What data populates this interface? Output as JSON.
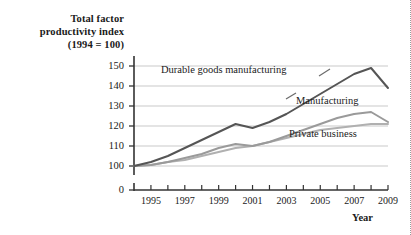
{
  "axis": {
    "y_title_line1": "Total factor",
    "y_title_line2": "productivity index",
    "y_title_line3": "(1994 = 100)",
    "x_title": "Year"
  },
  "chart_data": {
    "type": "line",
    "title": "",
    "subtitle": "",
    "xlabel": "Year",
    "ylabel": "Total factor productivity index (1994 = 100)",
    "grid": true,
    "legend_position": "inline-annotations",
    "xlim": [
      1994,
      2009
    ],
    "ylim": [
      100,
      150
    ],
    "y_axis_break": true,
    "y_ticks": [
      0,
      100,
      110,
      120,
      130,
      140,
      150
    ],
    "y_tick_labels": [
      "0",
      "100",
      "110",
      "120",
      "130",
      "140",
      "150"
    ],
    "x": [
      1994,
      1995,
      1996,
      1997,
      1998,
      1999,
      2000,
      2001,
      2002,
      2003,
      2004,
      2005,
      2006,
      2007,
      2008,
      2009
    ],
    "x_tick_labels": [
      "1995",
      "1997",
      "1999",
      "2001",
      "2003",
      "2005",
      "2007",
      "2009"
    ],
    "x_tick_label_years": [
      1995,
      1997,
      1999,
      2001,
      2003,
      2005,
      2007,
      2009
    ],
    "series": [
      {
        "name": "Durable goods manufacturing",
        "color": "#555555",
        "width": 2.0,
        "values": [
          100,
          102,
          105,
          109,
          113,
          117,
          121,
          119,
          122,
          126,
          131,
          136,
          141,
          146,
          149,
          139
        ]
      },
      {
        "name": "Manufacturing",
        "color": "#9a9a9a",
        "width": 2.0,
        "values": [
          100,
          100.5,
          102,
          104,
          106,
          109,
          111,
          110,
          112,
          115,
          118,
          121,
          124,
          126,
          127,
          122
        ]
      },
      {
        "name": "Private business",
        "color": "#b0b0b0",
        "width": 2.0,
        "values": [
          100,
          100.5,
          102,
          103,
          105,
          107,
          109,
          110,
          112,
          114,
          116,
          118,
          119,
          120,
          121,
          121
        ]
      }
    ],
    "annotations": [
      {
        "text": "Durable goods manufacturing",
        "series": "Durable goods manufacturing"
      },
      {
        "text": "Manufacturing",
        "series": "Manufacturing"
      },
      {
        "text": "Private business",
        "series": "Private business"
      }
    ]
  },
  "colors": {
    "gridline": "#c9c9c9",
    "axis": "#333333",
    "durable": "#555555",
    "manufacturing": "#9a9a9a",
    "private": "#b0b0b0"
  }
}
